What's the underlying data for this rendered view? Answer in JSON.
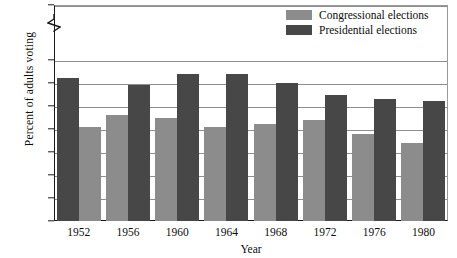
{
  "chart_data": {
    "type": "bar",
    "title": "",
    "xlabel": "Year",
    "ylabel": "Percent of adults voting",
    "categories": [
      "1952",
      "1956",
      "1960",
      "1964",
      "1968",
      "1972",
      "1976",
      "1980"
    ],
    "series": [
      {
        "name": "Congressional elections",
        "color": "#8c8c8c",
        "values": [
          41,
          46,
          45,
          41,
          42,
          44,
          38,
          34
        ]
      },
      {
        "name": "Presidential elections",
        "color": "#474747",
        "values": [
          62,
          59,
          64,
          64,
          60,
          55,
          53,
          52
        ]
      }
    ],
    "ylim": [
      0,
      70
    ],
    "ytick_labels": [
      "0",
      "10",
      "20",
      "30",
      "40",
      "50",
      "60",
      "70",
      "100"
    ],
    "ytick_values": [
      0,
      10,
      20,
      30,
      40,
      50,
      60,
      70,
      100
    ],
    "y_axis_break": true,
    "y_axis_break_between": [
      70,
      100
    ],
    "grid": true,
    "grid_axis": "y",
    "legend_position": "top-right",
    "bar_order": [
      "Congressional elections",
      "Presidential elections"
    ]
  },
  "legend": {
    "items": [
      {
        "label": "Congressional elections",
        "color": "#8c8c8c"
      },
      {
        "label": "Presidential elections",
        "color": "#474747"
      }
    ]
  },
  "axes": {
    "y_title": "Percent of adults voting",
    "x_title": "Year"
  }
}
